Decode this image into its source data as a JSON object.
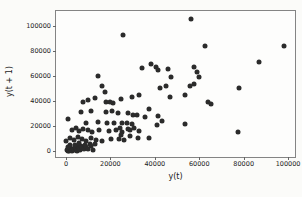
{
  "figure": {
    "bg_color": "#fbfbf9",
    "plot_bg_color": "#fdfdfc",
    "border_color": "#848484",
    "point_color": "#2b2b2b",
    "tick_color": "#666666",
    "text_color": "#222222"
  },
  "chart_data": {
    "type": "scatter",
    "title": "",
    "xlabel": "y(t)",
    "ylabel": "y(t + 1)",
    "xlim": [
      -4500,
      103100
    ],
    "ylim": [
      -4400,
      111700
    ],
    "x_ticks": [
      0,
      20000,
      40000,
      60000,
      80000,
      100000
    ],
    "y_ticks": [
      0,
      20000,
      40000,
      60000,
      80000,
      100000
    ],
    "x_tick_labels": [
      "0",
      "20000",
      "40000",
      "60000",
      "80000",
      "100000"
    ],
    "y_tick_labels": [
      "0",
      "20000",
      "40000",
      "60000",
      "80000",
      "100000"
    ],
    "grid": false,
    "legend": null,
    "marker": {
      "shape": "circle",
      "size_px": 5
    },
    "points": [
      [
        25800,
        92500
      ],
      [
        14200,
        60300
      ],
      [
        56100,
        105700
      ],
      [
        62800,
        83800
      ],
      [
        98200,
        83800
      ],
      [
        86700,
        70800
      ],
      [
        34200,
        66100
      ],
      [
        38400,
        69200
      ],
      [
        40500,
        67300
      ],
      [
        41400,
        64500
      ],
      [
        46100,
        65300
      ],
      [
        47200,
        59500
      ],
      [
        57700,
        67300
      ],
      [
        58900,
        63400
      ],
      [
        59800,
        59500
      ],
      [
        16400,
        52200
      ],
      [
        17500,
        47500
      ],
      [
        9700,
        41000
      ],
      [
        13100,
        42800
      ],
      [
        7700,
        39200
      ],
      [
        18200,
        39200
      ],
      [
        19600,
        39700
      ],
      [
        21100,
        38400
      ],
      [
        24600,
        41800
      ],
      [
        29500,
        43600
      ],
      [
        32700,
        44900
      ],
      [
        42400,
        50700
      ],
      [
        45000,
        52200
      ],
      [
        46900,
        43600
      ],
      [
        53600,
        44900
      ],
      [
        55800,
        52200
      ],
      [
        57700,
        53300
      ],
      [
        64000,
        39700
      ],
      [
        65200,
        37600
      ],
      [
        77700,
        50100
      ],
      [
        37500,
        34000
      ],
      [
        32000,
        29300
      ],
      [
        35700,
        27200
      ],
      [
        41400,
        28000
      ],
      [
        43400,
        24000
      ],
      [
        41000,
        21000
      ],
      [
        53500,
        21500
      ],
      [
        6700,
        31500
      ],
      [
        11200,
        32100
      ],
      [
        18200,
        31300
      ],
      [
        20800,
        32100
      ],
      [
        23500,
        30300
      ],
      [
        28000,
        30900
      ],
      [
        30000,
        29300
      ],
      [
        800,
        25600
      ],
      [
        8900,
        23000
      ],
      [
        14600,
        23500
      ],
      [
        18600,
        22500
      ],
      [
        21600,
        23000
      ],
      [
        25000,
        22500
      ],
      [
        27500,
        23000
      ],
      [
        29500,
        21700
      ],
      [
        2700,
        17200
      ],
      [
        4500,
        18600
      ],
      [
        5700,
        16400
      ],
      [
        7500,
        17800
      ],
      [
        9700,
        17200
      ],
      [
        11900,
        15700
      ],
      [
        14900,
        17200
      ],
      [
        19300,
        16400
      ],
      [
        22300,
        17200
      ],
      [
        25300,
        15700
      ],
      [
        28600,
        17200
      ],
      [
        30800,
        18300
      ],
      [
        32900,
        16200
      ],
      [
        24400,
        18800
      ],
      [
        27800,
        17800
      ],
      [
        24900,
        13100
      ],
      [
        28900,
        12500
      ],
      [
        32600,
        10700
      ],
      [
        37400,
        10500
      ],
      [
        23700,
        9900
      ],
      [
        0,
        8600
      ],
      [
        1800,
        10500
      ],
      [
        3700,
        9400
      ],
      [
        5200,
        11300
      ],
      [
        7100,
        9900
      ],
      [
        8900,
        8600
      ],
      [
        11200,
        10500
      ],
      [
        13400,
        9400
      ],
      [
        16400,
        8600
      ],
      [
        20100,
        9900
      ],
      [
        26000,
        9400
      ],
      [
        77400,
        15200
      ],
      [
        300,
        900
      ],
      [
        700,
        300
      ],
      [
        1100,
        1800
      ],
      [
        1500,
        700
      ],
      [
        1900,
        2600
      ],
      [
        2300,
        1200
      ],
      [
        2700,
        300
      ],
      [
        3100,
        2100
      ],
      [
        3500,
        900
      ],
      [
        3900,
        3300
      ],
      [
        4300,
        1500
      ],
      [
        4700,
        2700
      ],
      [
        5100,
        600
      ],
      [
        5500,
        3900
      ],
      [
        5900,
        2100
      ],
      [
        6400,
        1200
      ],
      [
        6900,
        4400
      ],
      [
        7400,
        2900
      ],
      [
        8000,
        1700
      ],
      [
        8600,
        5000
      ],
      [
        9200,
        3400
      ],
      [
        9900,
        2300
      ],
      [
        10600,
        5600
      ],
      [
        11400,
        4100
      ],
      [
        12300,
        1000
      ],
      [
        13200,
        6200
      ],
      [
        2000,
        4800
      ],
      [
        900,
        3900
      ],
      [
        4000,
        5200
      ],
      [
        6000,
        6500
      ]
    ]
  }
}
